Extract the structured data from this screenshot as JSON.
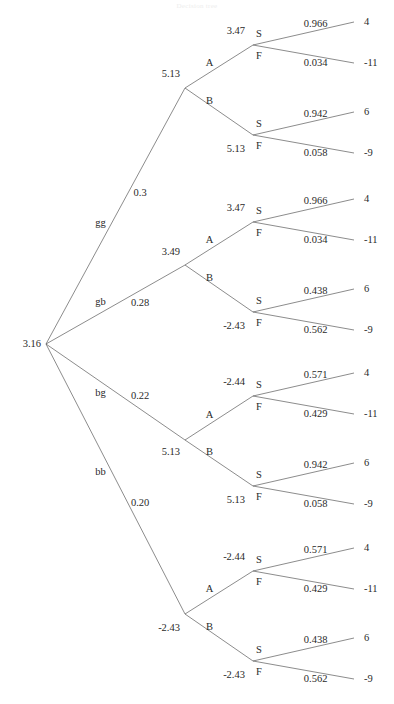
{
  "figure": {
    "title_faint": "Decision tree",
    "root": {
      "label": "3.16",
      "x": 44,
      "y": 344
    },
    "line_color": "#5a5a5a",
    "text_color": "#2a2a2a",
    "background": "#ffffff",
    "payoff_labels": [
      "4",
      "-11",
      "6",
      "-9"
    ],
    "decision_labels": [
      "A",
      "B"
    ],
    "outcome_labels": [
      "S",
      "F"
    ]
  },
  "chart_data": {
    "type": "diagram",
    "diagram_kind": "decision-tree",
    "title": "Decision tree",
    "root": {
      "value": "3.16"
    },
    "branches": [
      {
        "name": "gg",
        "probability": "0.3",
        "node_value": "5.13",
        "decisions": [
          {
            "label": "A",
            "value": "3.47",
            "outcomes": [
              {
                "label": "S",
                "probability": "0.966",
                "payoff": "4"
              },
              {
                "label": "F",
                "probability": "0.034",
                "payoff": "-11"
              }
            ]
          },
          {
            "label": "B",
            "value": "5.13",
            "outcomes": [
              {
                "label": "S",
                "probability": "0.942",
                "payoff": "6"
              },
              {
                "label": "F",
                "probability": "0.058",
                "payoff": "-9"
              }
            ]
          }
        ]
      },
      {
        "name": "gb",
        "probability": "0.28",
        "node_value": "3.49",
        "decisions": [
          {
            "label": "A",
            "value": "3.47",
            "outcomes": [
              {
                "label": "S",
                "probability": "0.966",
                "payoff": "4"
              },
              {
                "label": "F",
                "probability": "0.034",
                "payoff": "-11"
              }
            ]
          },
          {
            "label": "B",
            "value": "-2.43",
            "outcomes": [
              {
                "label": "S",
                "probability": "0.438",
                "payoff": "6"
              },
              {
                "label": "F",
                "probability": "0.562",
                "payoff": "-9"
              }
            ]
          }
        ]
      },
      {
        "name": "bg",
        "probability": "0.22",
        "node_value": "5.13",
        "decisions": [
          {
            "label": "A",
            "value": "-2.44",
            "outcomes": [
              {
                "label": "S",
                "probability": "0.571",
                "payoff": "4"
              },
              {
                "label": "F",
                "probability": "0.429",
                "payoff": "-11"
              }
            ]
          },
          {
            "label": "B",
            "value": "5.13",
            "outcomes": [
              {
                "label": "S",
                "probability": "0.942",
                "payoff": "6"
              },
              {
                "label": "F",
                "probability": "0.058",
                "payoff": "-9"
              }
            ]
          }
        ]
      },
      {
        "name": "bb",
        "probability": "0.20",
        "node_value": "-2.43",
        "decisions": [
          {
            "label": "A",
            "value": "-2.44",
            "outcomes": [
              {
                "label": "S",
                "probability": "0.571",
                "payoff": "4"
              },
              {
                "label": "F",
                "probability": "0.429",
                "payoff": "-11"
              }
            ]
          },
          {
            "label": "B",
            "value": "-2.43",
            "outcomes": [
              {
                "label": "S",
                "probability": "0.438",
                "payoff": "6"
              },
              {
                "label": "F",
                "probability": "0.562",
                "payoff": "-9"
              }
            ]
          }
        ]
      }
    ]
  }
}
